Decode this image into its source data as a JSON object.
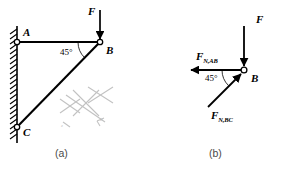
{
  "figure": {
    "background_color": "#ffffff",
    "line_color": "#000000",
    "watermark_color": "#c8c8c8"
  },
  "panel_a": {
    "caption": "(a)",
    "points": [
      {
        "id": "A",
        "label": "A",
        "x": 17,
        "y": 42,
        "type": "pin-joint"
      },
      {
        "id": "B",
        "label": "B",
        "x": 100,
        "y": 42,
        "type": "pin-joint"
      },
      {
        "id": "C",
        "label": "C",
        "x": 17,
        "y": 127,
        "type": "pin-joint"
      }
    ],
    "members": [
      {
        "id": "AB",
        "from": "A",
        "to": "B",
        "orientation": "horizontal"
      },
      {
        "id": "BC",
        "from": "B",
        "to": "C",
        "orientation": "diagonal"
      }
    ],
    "angle": {
      "label": "45°",
      "value": 45,
      "at": "B",
      "between": "AB-BC"
    },
    "load": {
      "label": "F",
      "direction": "down",
      "applied_at": "B"
    },
    "support": {
      "type": "fixed-wall",
      "side": "left",
      "hatching": true
    },
    "watermark": {
      "present": true,
      "marks": [
        "x-mark",
        "x-mark",
        "x-mark"
      ],
      "text_left": "z",
      "text_right": "b"
    }
  },
  "panel_b": {
    "caption": "(b)",
    "joint": {
      "id": "B",
      "label": "B",
      "x": 244,
      "y": 70,
      "type": "pin-joint"
    },
    "forces": [
      {
        "id": "F",
        "symbol": "F",
        "subscript": "",
        "direction": "down",
        "label_x": 258,
        "label_y": 18
      },
      {
        "id": "F_N_AB",
        "symbol": "F",
        "subscript": "N,AB",
        "direction": "left",
        "label_x": 196,
        "label_y": 50
      },
      {
        "id": "F_N_BC",
        "symbol": "F",
        "subscript": "N,BC",
        "direction": "down-left",
        "label_x": 212,
        "label_y": 112
      }
    ],
    "angle": {
      "label": "45°",
      "value": 45,
      "at": "B",
      "between": "F_N_AB-F_N_BC"
    }
  }
}
